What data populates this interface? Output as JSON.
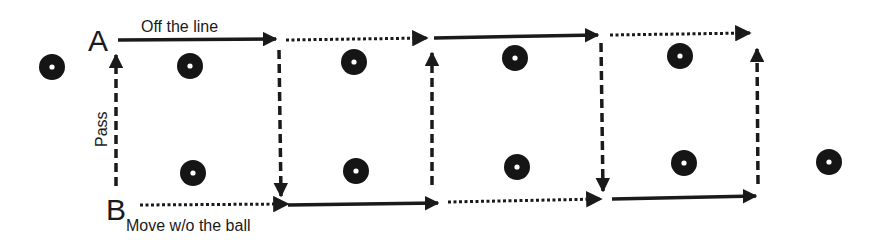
{
  "colors": {
    "ink": "#1a1a1a",
    "cone": "#151515",
    "cone_center": "#ffffff",
    "background": "#ffffff"
  },
  "labels": {
    "player_a": "A",
    "player_b": "B",
    "off_the_line": "Off the line",
    "move_without_ball": "Move w/o the ball",
    "pass": "Pass"
  },
  "legend_styles": {
    "solid": "Off the line (run with ball)",
    "dotted": "Move w/o the ball",
    "dashed": "Pass"
  },
  "cones": [
    {
      "x": 52,
      "y": 67
    },
    {
      "x": 190,
      "y": 66
    },
    {
      "x": 354,
      "y": 62
    },
    {
      "x": 515,
      "y": 58
    },
    {
      "x": 680,
      "y": 56
    },
    {
      "x": 193,
      "y": 173
    },
    {
      "x": 356,
      "y": 171
    },
    {
      "x": 517,
      "y": 167
    },
    {
      "x": 684,
      "y": 163
    },
    {
      "x": 829,
      "y": 162
    }
  ],
  "arrows": [
    {
      "style": "solid",
      "x1": 118,
      "y1": 40,
      "x2": 276,
      "y2": 39
    },
    {
      "style": "dotted",
      "x1": 286,
      "y1": 40,
      "x2": 427,
      "y2": 38
    },
    {
      "style": "solid",
      "x1": 434,
      "y1": 38,
      "x2": 598,
      "y2": 35
    },
    {
      "style": "dotted",
      "x1": 610,
      "y1": 35,
      "x2": 750,
      "y2": 33
    },
    {
      "style": "dotted",
      "x1": 140,
      "y1": 205,
      "x2": 288,
      "y2": 204
    },
    {
      "style": "solid",
      "x1": 288,
      "y1": 205,
      "x2": 438,
      "y2": 203
    },
    {
      "style": "dotted",
      "x1": 448,
      "y1": 202,
      "x2": 601,
      "y2": 199
    },
    {
      "style": "solid",
      "x1": 612,
      "y1": 199,
      "x2": 756,
      "y2": 196
    },
    {
      "style": "dashed",
      "x1": 116,
      "y1": 186,
      "x2": 116,
      "y2": 55
    },
    {
      "style": "dashed",
      "x1": 279,
      "y1": 50,
      "x2": 281,
      "y2": 196
    },
    {
      "style": "dashed",
      "x1": 432,
      "y1": 185,
      "x2": 432,
      "y2": 53
    },
    {
      "style": "dashed",
      "x1": 601,
      "y1": 43,
      "x2": 603,
      "y2": 191
    },
    {
      "style": "dashed",
      "x1": 758,
      "y1": 184,
      "x2": 757,
      "y2": 49
    }
  ]
}
